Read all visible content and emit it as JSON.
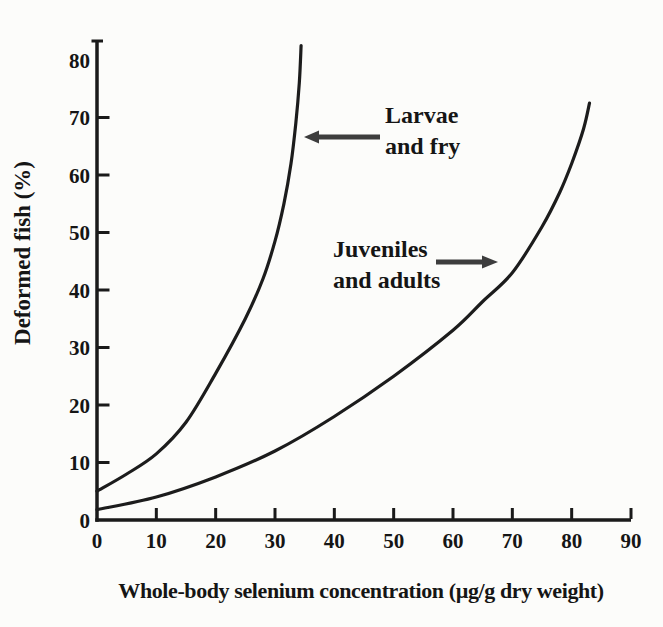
{
  "chart_data": {
    "type": "line",
    "title": "",
    "xlabel": "Whole-body selenium concentration (µg/g dry weight)",
    "ylabel": "Deformed fish (%)",
    "xlim": [
      0,
      90
    ],
    "ylim": [
      0,
      80
    ],
    "grid": false,
    "legend_position": "inline-annotations",
    "x_axis": {
      "min": 0,
      "max": 90,
      "ticks": [
        0,
        10,
        20,
        30,
        40,
        50,
        60,
        70,
        80,
        90
      ]
    },
    "y_axis": {
      "min": 0,
      "max": 80,
      "ticks": [
        0,
        10,
        20,
        30,
        40,
        50,
        60,
        70,
        80
      ]
    },
    "series": [
      {
        "name": "Larvae and fry",
        "points": [
          [
            0,
            5
          ],
          [
            5,
            8
          ],
          [
            10,
            11.5
          ],
          [
            15,
            17
          ],
          [
            20,
            25.5
          ],
          [
            25,
            35
          ],
          [
            28,
            42
          ],
          [
            30,
            48.5
          ],
          [
            31.5,
            55
          ],
          [
            32.7,
            62
          ],
          [
            33.5,
            69
          ],
          [
            34.1,
            76
          ],
          [
            34.4,
            82.5
          ]
        ]
      },
      {
        "name": "Juveniles and adults",
        "points": [
          [
            0,
            1.8
          ],
          [
            10,
            4
          ],
          [
            20,
            7.5
          ],
          [
            30,
            12
          ],
          [
            40,
            18
          ],
          [
            50,
            25
          ],
          [
            60,
            33
          ],
          [
            65,
            38
          ],
          [
            70,
            43
          ],
          [
            75,
            51
          ],
          [
            78,
            57
          ],
          [
            80,
            62
          ],
          [
            82,
            68
          ],
          [
            83,
            72.5
          ]
        ]
      }
    ],
    "annotations": [
      {
        "text": "Larvae\nand fry",
        "arrow_direction": "left",
        "points_to": "Larvae and fry"
      },
      {
        "text": "Juveniles\nand adults",
        "arrow_direction": "right",
        "points_to": "Juveniles and adults"
      }
    ],
    "colors": {
      "line": "#1c1c1c",
      "axis": "#1a1a1a",
      "text": "#151515",
      "arrow": "#3d3d3d",
      "background": "#fcfcfa"
    }
  }
}
